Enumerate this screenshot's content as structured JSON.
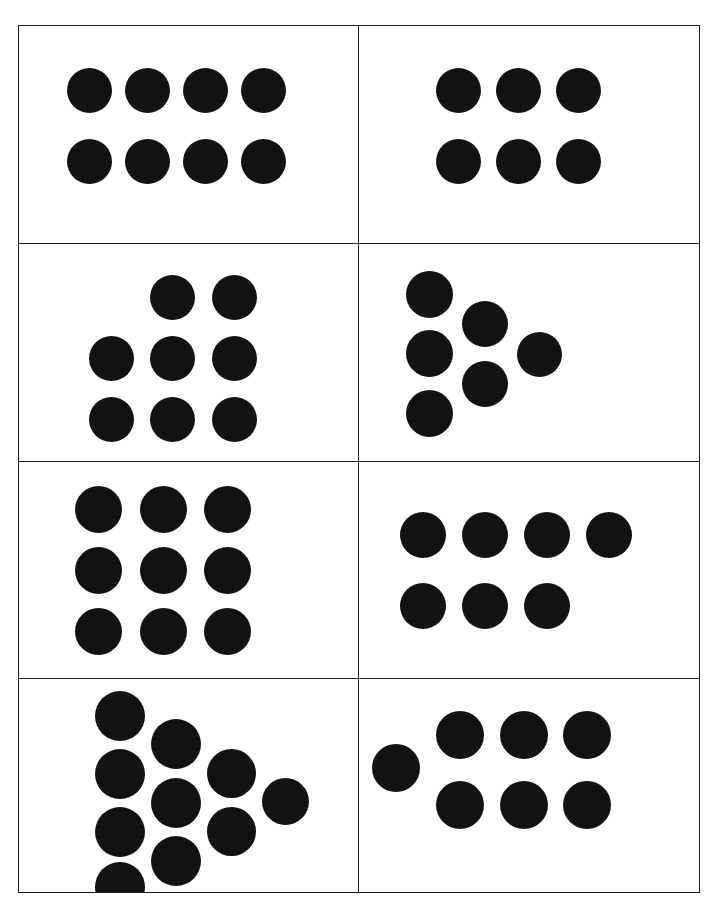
{
  "page": {
    "background_color": "#ffffff",
    "width": 717,
    "height": 915
  },
  "table": {
    "border_color": "#1c1c1c",
    "columns": 2,
    "rows": 4,
    "cell_count": 8
  },
  "dot": {
    "color": "#121212",
    "shape": "circle",
    "default_diameter": 45
  },
  "chart_data": {
    "type": "scatter",
    "title": "",
    "xlabel": "",
    "ylabel": "",
    "panels": [
      {
        "index": 1,
        "position": "row-1-left",
        "dot_count": 8,
        "arrangement": "4 by 2 rectangular array",
        "rows": [
          4,
          4
        ],
        "dots": [
          {
            "x": 48,
            "y": 42,
            "d": 45
          },
          {
            "x": 106,
            "y": 42,
            "d": 45
          },
          {
            "x": 164,
            "y": 42,
            "d": 45
          },
          {
            "x": 222,
            "y": 42,
            "d": 45
          },
          {
            "x": 48,
            "y": 113,
            "d": 45
          },
          {
            "x": 106,
            "y": 113,
            "d": 45
          },
          {
            "x": 164,
            "y": 113,
            "d": 45
          },
          {
            "x": 222,
            "y": 113,
            "d": 45
          }
        ]
      },
      {
        "index": 2,
        "position": "row-1-right",
        "dot_count": 6,
        "arrangement": "3 by 2 rectangular array",
        "rows": [
          3,
          3
        ],
        "dots": [
          {
            "x": 77,
            "y": 42,
            "d": 45
          },
          {
            "x": 137,
            "y": 42,
            "d": 45
          },
          {
            "x": 197,
            "y": 42,
            "d": 45
          },
          {
            "x": 77,
            "y": 113,
            "d": 45
          },
          {
            "x": 137,
            "y": 113,
            "d": 45
          },
          {
            "x": 197,
            "y": 113,
            "d": 45
          }
        ]
      },
      {
        "index": 3,
        "position": "row-2-left",
        "dot_count": 8,
        "arrangement": "3 by 3 array missing the top-left dot",
        "rows": [
          2,
          3,
          3
        ],
        "dots": [
          {
            "x": 131,
            "y": 31,
            "d": 45
          },
          {
            "x": 193,
            "y": 31,
            "d": 45
          },
          {
            "x": 70,
            "y": 92,
            "d": 45
          },
          {
            "x": 131,
            "y": 92,
            "d": 45
          },
          {
            "x": 193,
            "y": 92,
            "d": 45
          },
          {
            "x": 70,
            "y": 153,
            "d": 45
          },
          {
            "x": 131,
            "y": 153,
            "d": 45
          },
          {
            "x": 193,
            "y": 153,
            "d": 45
          }
        ]
      },
      {
        "index": 4,
        "position": "row-2-right",
        "dot_count": 6,
        "arrangement": "right-pointing chevron: 3 dots, 2 dots, 1 dot",
        "rows": [
          3,
          2,
          1
        ],
        "dots": [
          {
            "x": 47,
            "y": 27,
            "d": 47
          },
          {
            "x": 47,
            "y": 86,
            "d": 47
          },
          {
            "x": 47,
            "y": 146,
            "d": 47
          },
          {
            "x": 103,
            "y": 57,
            "d": 46
          },
          {
            "x": 103,
            "y": 117,
            "d": 46
          },
          {
            "x": 158,
            "y": 88,
            "d": 45
          }
        ]
      },
      {
        "index": 5,
        "position": "row-3-left",
        "dot_count": 9,
        "arrangement": "3 by 3 rectangular array",
        "rows": [
          3,
          3,
          3
        ],
        "dots": [
          {
            "x": 56,
            "y": 24,
            "d": 47
          },
          {
            "x": 121,
            "y": 24,
            "d": 47
          },
          {
            "x": 185,
            "y": 24,
            "d": 47
          },
          {
            "x": 56,
            "y": 85,
            "d": 47
          },
          {
            "x": 121,
            "y": 85,
            "d": 47
          },
          {
            "x": 185,
            "y": 85,
            "d": 47
          },
          {
            "x": 56,
            "y": 146,
            "d": 47
          },
          {
            "x": 121,
            "y": 146,
            "d": 47
          },
          {
            "x": 185,
            "y": 146,
            "d": 47
          }
        ]
      },
      {
        "index": 6,
        "position": "row-3-right",
        "dot_count": 7,
        "arrangement": "top row of 4 dots over bottom row of 3 dots",
        "rows": [
          4,
          3
        ],
        "dots": [
          {
            "x": 41,
            "y": 50,
            "d": 46
          },
          {
            "x": 103,
            "y": 50,
            "d": 46
          },
          {
            "x": 165,
            "y": 50,
            "d": 46
          },
          {
            "x": 227,
            "y": 50,
            "d": 46
          },
          {
            "x": 41,
            "y": 121,
            "d": 46
          },
          {
            "x": 103,
            "y": 121,
            "d": 46
          },
          {
            "x": 165,
            "y": 121,
            "d": 46
          }
        ]
      },
      {
        "index": 7,
        "position": "row-4-left",
        "dot_count": 10,
        "arrangement": "right-pointing arrow: columns of 4, 3, 2 and 1 dots",
        "rows": [
          4,
          3,
          2,
          1
        ],
        "dots": [
          {
            "x": 76,
            "y": 12,
            "d": 50
          },
          {
            "x": 76,
            "y": 70,
            "d": 50
          },
          {
            "x": 76,
            "y": 128,
            "d": 50
          },
          {
            "x": 76,
            "y": 183,
            "d": 50
          },
          {
            "x": 132,
            "y": 40,
            "d": 50
          },
          {
            "x": 132,
            "y": 99,
            "d": 50
          },
          {
            "x": 132,
            "y": 157,
            "d": 50
          },
          {
            "x": 188,
            "y": 70,
            "d": 49
          },
          {
            "x": 188,
            "y": 128,
            "d": 49
          },
          {
            "x": 243,
            "y": 99,
            "d": 47
          }
        ]
      },
      {
        "index": 8,
        "position": "row-4-right",
        "dot_count": 7,
        "arrangement": "single dot at left plus a 3 by 2 array",
        "rows": [
          1,
          4,
          3
        ],
        "dots": [
          {
            "x": 13,
            "y": 65,
            "d": 48
          },
          {
            "x": 77,
            "y": 32,
            "d": 48
          },
          {
            "x": 141,
            "y": 32,
            "d": 48
          },
          {
            "x": 204,
            "y": 32,
            "d": 48
          },
          {
            "x": 77,
            "y": 102,
            "d": 48
          },
          {
            "x": 141,
            "y": 102,
            "d": 48
          },
          {
            "x": 204,
            "y": 102,
            "d": 48
          }
        ]
      }
    ]
  }
}
